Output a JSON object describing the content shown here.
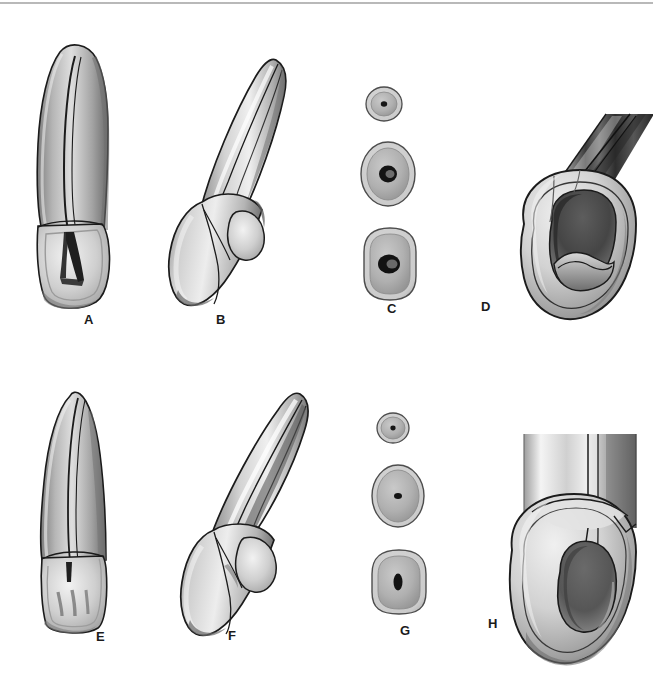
{
  "figure": {
    "domain_note": "grayscale dental anatomy line/tone illustration",
    "background_color": "#ffffff",
    "ink_color": "#1b1b1b",
    "top_rule_color": "#8e8e8e",
    "width": 653,
    "height": 693
  },
  "panels": [
    {
      "id": "A",
      "label": "A",
      "label_x": 84,
      "label_y": 313,
      "view_name": "root-and-crown-proximal-section-view",
      "row": 1,
      "column": 1
    },
    {
      "id": "B",
      "label": "B",
      "label_x": 216,
      "label_y": 313,
      "view_name": "root-and-crown-angled-labial-view",
      "row": 1,
      "column": 2
    },
    {
      "id": "C",
      "label": "C",
      "label_x": 387,
      "label_y": 302,
      "view_name": "root-cross-sections-series",
      "row": 1,
      "column": 3
    },
    {
      "id": "D",
      "label": "D",
      "label_x": 481,
      "label_y": 300,
      "view_name": "pulp-chamber-access-opening-view",
      "row": 1,
      "column": 4
    },
    {
      "id": "E",
      "label": "E",
      "label_x": 96,
      "label_y": 630,
      "view_name": "root-and-crown-labial-section-view",
      "row": 2,
      "column": 1
    },
    {
      "id": "F",
      "label": "F",
      "label_x": 228,
      "label_y": 629,
      "view_name": "root-and-crown-angled-proximal-view",
      "row": 2,
      "column": 2
    },
    {
      "id": "G",
      "label": "G",
      "label_x": 400,
      "label_y": 624,
      "view_name": "root-cross-sections-series",
      "row": 2,
      "column": 3
    },
    {
      "id": "H",
      "label": "H",
      "label_x": 488,
      "label_y": 617,
      "view_name": "pulp-chamber-access-opening-view",
      "row": 2,
      "column": 4
    }
  ],
  "cross_sections": {
    "panel_c": [
      {
        "index": 1,
        "level": "apical",
        "shape": "small-round",
        "canal_shape": "pinpoint-round"
      },
      {
        "index": 2,
        "level": "middle",
        "shape": "oval",
        "canal_shape": "round-oval"
      },
      {
        "index": 3,
        "level": "cervical",
        "shape": "rounded-rectangle",
        "canal_shape": "wide-oval"
      }
    ],
    "panel_g": [
      {
        "index": 1,
        "level": "apical",
        "shape": "small-round",
        "canal_shape": "pinpoint-round"
      },
      {
        "index": 2,
        "level": "middle",
        "shape": "oval",
        "canal_shape": "narrow-slit"
      },
      {
        "index": 3,
        "level": "cervical",
        "shape": "rounded-rectangle",
        "canal_shape": "narrow-slit"
      }
    ]
  }
}
